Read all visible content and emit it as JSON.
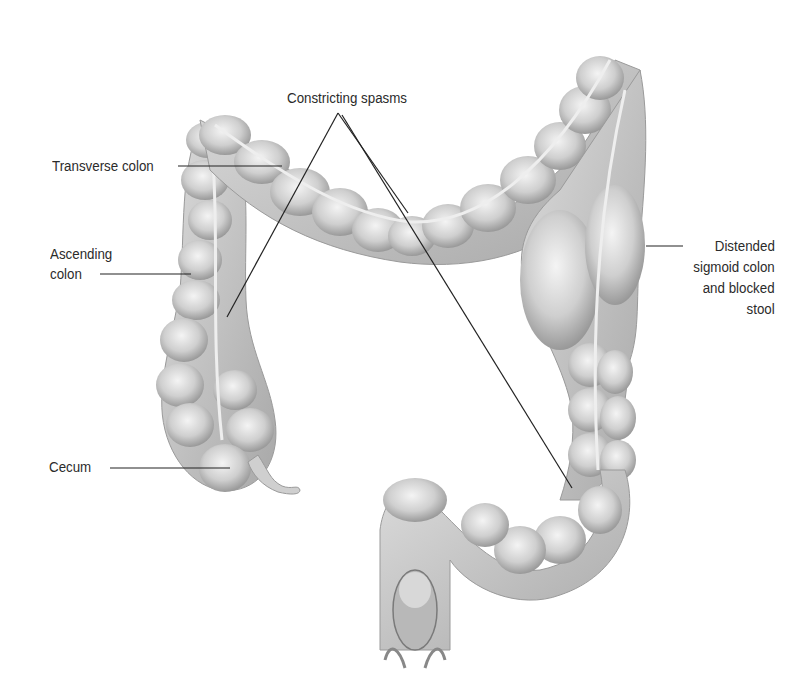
{
  "diagram": {
    "labels": {
      "constricting_spasms": "Constricting spasms",
      "transverse_colon": "Transverse colon",
      "ascending_colon_line1": "Ascending",
      "ascending_colon_line2": "colon",
      "cecum": "Cecum",
      "distended_line1": "Distended",
      "distended_line2": "sigmoid colon",
      "distended_line3": "and blocked",
      "distended_line4": "stool"
    },
    "colors": {
      "background": "#ffffff",
      "text": "#2b2b2b",
      "leader_line": "#222222",
      "tissue_light": "#e6e6e6",
      "tissue_mid": "#c2c2c2",
      "tissue_dark": "#8f8f8f"
    }
  }
}
